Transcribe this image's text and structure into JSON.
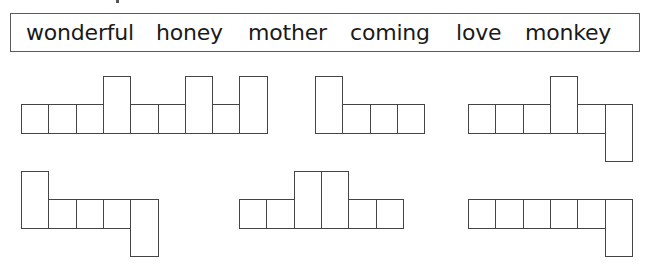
{
  "word_bank": {
    "words": [
      {
        "text": "wonderful",
        "x": 25
      },
      {
        "text": "honey",
        "x": 155
      },
      {
        "text": "mother",
        "x": 247
      },
      {
        "text": "coming",
        "x": 349
      },
      {
        "text": "love",
        "x": 455
      },
      {
        "text": "monkey",
        "x": 524
      }
    ]
  },
  "shapes": [
    {
      "name": "shape-1",
      "x": 21,
      "baseline_top": 104,
      "pattern": [
        "s",
        "s",
        "s",
        "t",
        "s",
        "s",
        "t",
        "s",
        "t"
      ]
    },
    {
      "name": "shape-2",
      "x": 315,
      "baseline_top": 104,
      "pattern": [
        "t",
        "s",
        "s",
        "s"
      ]
    },
    {
      "name": "shape-3",
      "x": 468,
      "baseline_top": 104,
      "pattern": [
        "s",
        "s",
        "s",
        "t",
        "s",
        "d"
      ]
    },
    {
      "name": "shape-4",
      "x": 21,
      "baseline_top": 199,
      "pattern": [
        "t",
        "s",
        "s",
        "s",
        "d"
      ]
    },
    {
      "name": "shape-5",
      "x": 239,
      "baseline_top": 199,
      "pattern": [
        "s",
        "s",
        "t",
        "t",
        "s",
        "s"
      ]
    },
    {
      "name": "shape-6",
      "x": 468,
      "baseline_top": 199,
      "pattern": [
        "s",
        "s",
        "s",
        "s",
        "s",
        "d"
      ]
    }
  ],
  "cell": {
    "width": 27.3,
    "short_height": 29,
    "tall_extra": 28,
    "desc_extra": 28
  }
}
